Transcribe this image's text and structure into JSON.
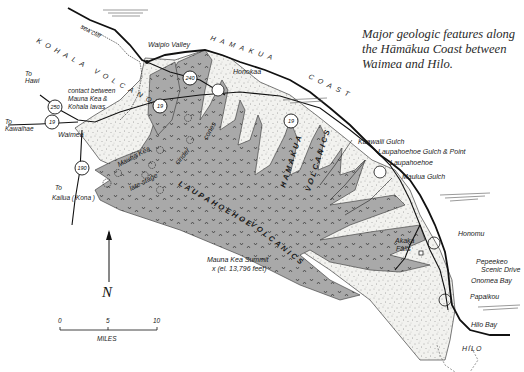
{
  "caption": "Major geologic features along the Hāmākua Coast between Waimea and Hilo.",
  "regions": {
    "kohala_volcano": "KOHALA VOLCANO",
    "hamakua_coast_1": "HAMAKUA",
    "hamakua_coast_2": "COAST",
    "hamakua_volcanics_1": "HAMAKUA",
    "hamakua_volcanics_2": "VOLCANICS",
    "laupahoehoe_volcanics_1": "LAUPAHOEHOE",
    "laupahoehoe_volcanics_2": "VOLCANICS",
    "cinder_cones_1": "Mauna Kea",
    "cinder_cones_2": "late-stage",
    "cinder_cones_3": "cinder",
    "cinder_cones_4": "cones"
  },
  "places": {
    "sea_cliff": "sea cliff",
    "waipio_valley": "Waipio Valley",
    "honokaa": "Honokaa",
    "contact_1": "contact between",
    "contact_2": "Mauna Kea &",
    "contact_3": "Kohala lavas",
    "waimea": "Waimea",
    "to_hawi_1": "To",
    "to_hawi_2": "Hawi",
    "to_kawaihae_1": "To",
    "to_kawaihae_2": "Kawaihae",
    "to_kailua_1": "To",
    "to_kailua_2": "Kailua ( Kona )",
    "kaawalii_gulch": "Kaawalii Gulch",
    "laupahoehoe_gulch": "Laupahoehoe Gulch & Point",
    "laupahoehoe": "Laupahoehoe",
    "maulua_gulch": "Maulua Gulch",
    "akaka_falls_1": "Akaka",
    "akaka_falls_2": "Falls",
    "honomu": "Honomu",
    "pepeekeo_1": "Pepeekeo",
    "pepeekeo_2": "Scenic Drive",
    "onomea_bay": "Onomea Bay",
    "papaikou": "Papaikou",
    "hilo_bay": "Hilo Bay",
    "hilo": "HILO",
    "summit_1": "Mauna Kea Summit",
    "summit_2": "x   (el. 13,796 feet)"
  },
  "highways": {
    "h250": "250",
    "h19_west": "19",
    "h190": "190",
    "h240": "240",
    "h19_mid": "19",
    "h19_east": "19"
  },
  "north_arrow": {
    "label": "N"
  },
  "scale_bar": {
    "ticks": [
      "0",
      "5",
      "10"
    ],
    "unit": "MILES"
  },
  "colors": {
    "laupahoehoe_fill": "#a9a9a9",
    "hamakua_fill": "#f1f1ee",
    "line": "#111111",
    "caption_text": "#2a2a2a"
  }
}
